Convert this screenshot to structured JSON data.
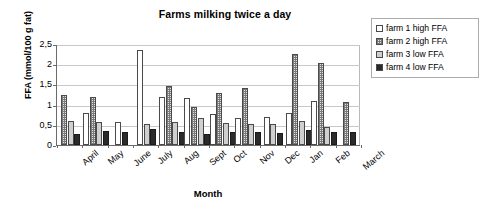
{
  "chart_data": {
    "type": "bar",
    "title": "Farms milking twice a day",
    "xlabel": "Month",
    "ylabel": "FFA (mmol/100 g fat)",
    "ylim": [
      0,
      2.5
    ],
    "yticks": [
      "0",
      "0,5",
      "1",
      "1,5",
      "2",
      "2,5"
    ],
    "ytick_values": [
      0,
      0.5,
      1,
      1.5,
      2,
      2.5
    ],
    "grid": true,
    "legend_position": "right",
    "categories": [
      "April",
      "May",
      "June",
      "July",
      "Aug",
      "Sept",
      "Oct",
      "Nov",
      "Dec",
      "Jan",
      "Feb",
      "March"
    ],
    "series": [
      {
        "name": "farm 1 high FFA",
        "swatch": "white-open",
        "values": [
          null,
          0.8,
          0.57,
          2.34,
          1.18,
          1.16,
          0.78,
          0.66,
          0.7,
          0.8,
          1.08,
          null
        ]
      },
      {
        "name": "farm 2 high FFA",
        "swatch": "dotted-gray",
        "values": [
          1.25,
          1.19,
          null,
          null,
          1.47,
          0.95,
          1.29,
          1.42,
          null,
          2.26,
          2.02,
          1.07
        ]
      },
      {
        "name": "farm 3 low FFA",
        "swatch": "light-gray",
        "values": [
          0.59,
          0.56,
          null,
          0.52,
          0.56,
          0.67,
          0.54,
          0.53,
          0.52,
          0.59,
          0.45,
          null
        ]
      },
      {
        "name": "farm 4 low FFA",
        "swatch": "black-solid",
        "values": [
          0.28,
          0.34,
          0.31,
          0.39,
          0.32,
          0.28,
          0.31,
          0.32,
          0.29,
          0.38,
          0.31,
          0.31
        ]
      }
    ]
  },
  "colors": {
    "series_1": "#ffffff",
    "series_2": "#e2e2e2",
    "series_3": "#cfcfcf",
    "series_4": "#2b2b2b",
    "axis": "#6b6b6b",
    "grid": "#c8c8c8",
    "text": "#000000"
  }
}
